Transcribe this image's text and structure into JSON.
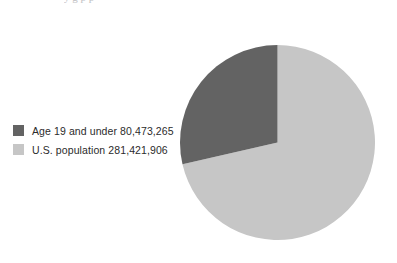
{
  "page": {
    "background_color": "#ffffff",
    "clipped_header_text": "y g p p"
  },
  "legend": {
    "position": "left",
    "items": [
      {
        "label": "Age 19 and under 80,473,265",
        "color": "#636363",
        "swatch_name": "legend-swatch-age-19-and-under"
      },
      {
        "label": "U.S. population 281,421,906",
        "color": "#c6c6c6",
        "swatch_name": "legend-swatch-us-population"
      }
    ]
  },
  "chart_data": {
    "type": "pie",
    "title": "",
    "subtitle": "",
    "xlabel": "",
    "ylabel": "",
    "grid": false,
    "legend_position": "left",
    "start_angle_deg": 0,
    "direction": "counterclockwise",
    "categories": [
      "Age 19 and under",
      "U.S. population"
    ],
    "values": [
      80473265,
      281421906
    ],
    "slices": [
      {
        "label": "Age 19 and under",
        "value": 80473265,
        "value_text": "80,473,265",
        "percent": 28.6,
        "color": "#636363"
      },
      {
        "label": "U.S. population",
        "value": 281421906,
        "value_text": "281,421,906",
        "percent": 71.4,
        "color": "#c6c6c6"
      }
    ],
    "geometry": {
      "center_x": 97.5,
      "center_y": 109.5,
      "radius": 97.5
    }
  }
}
